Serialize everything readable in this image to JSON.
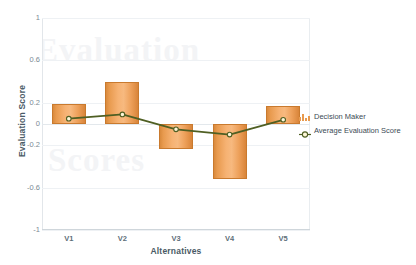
{
  "chart_data": {
    "type": "bar",
    "title": "",
    "subtitle": "",
    "xlabel": "Alternatives",
    "ylabel": "Evaluation Score",
    "categories": [
      "V1",
      "V2",
      "V3",
      "V4",
      "V5"
    ],
    "ylim": [
      -1,
      1
    ],
    "yticks": [
      1,
      0.6,
      0.2,
      0,
      -0.2,
      -0.6,
      -1
    ],
    "ytick_labels": [
      "1",
      "0.6",
      "0.2",
      "0",
      "-0.2",
      "-0.6",
      "-1"
    ],
    "grid": true,
    "legend_position": "right",
    "series": [
      {
        "name": "Decision Maker",
        "type": "bar",
        "color": "#e89a4e",
        "values": [
          0.19,
          0.4,
          -0.24,
          -0.52,
          0.17
        ]
      },
      {
        "name": "Average Evaluation Score",
        "type": "line",
        "color": "#4f5f23",
        "marker_color": "#fdf6d8",
        "values": [
          0.05,
          0.09,
          -0.05,
          -0.1,
          0.04
        ]
      }
    ]
  },
  "axes": {
    "y_title": "Evaluation Score",
    "x_title": "Alternatives"
  },
  "legend": {
    "items": [
      {
        "label": "Decision Maker",
        "icon": "bar-chart-icon"
      },
      {
        "label": "Average Evaluation Score",
        "icon": "line-marker-icon"
      }
    ]
  },
  "watermark": {
    "line1": "Evaluation",
    "line2": "Scores"
  },
  "colors": {
    "bar_fill": "#f1a85e",
    "bar_stroke": "#c97a2e",
    "line": "#4f5f23",
    "marker_fill": "#fdf6d8",
    "grid": "#eef1f4",
    "axis_text": "#7b8a94",
    "title_text": "#4a5a66",
    "background": "#ffffff"
  }
}
